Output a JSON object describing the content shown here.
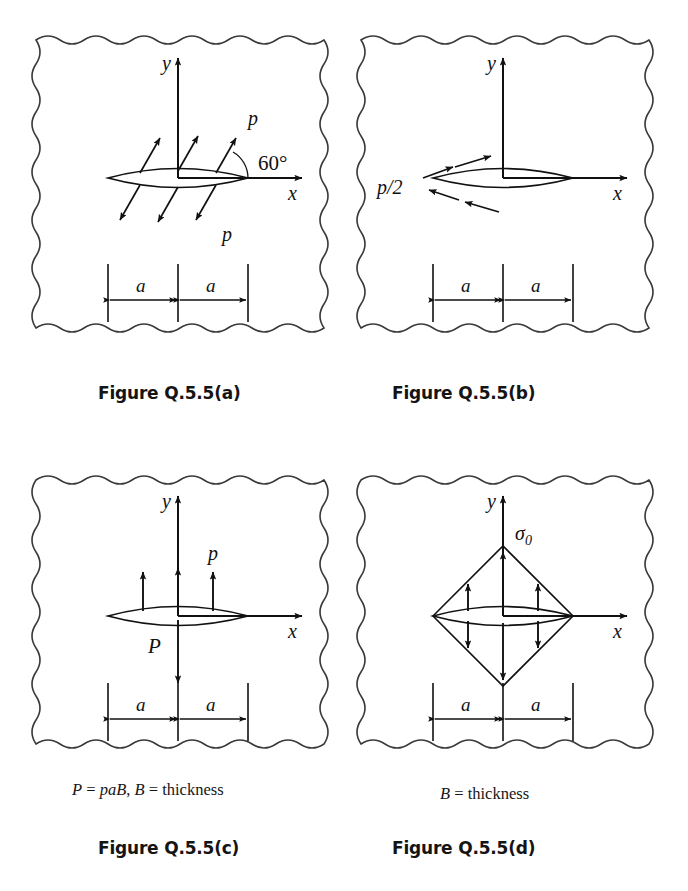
{
  "figure": {
    "title_prefix": "Figure Q.5.5",
    "background": "#ffffff",
    "ink": "#111111"
  },
  "panels": [
    {
      "id": "a",
      "caption": "Figure Q.5.5(a)",
      "axis_x_label": "x",
      "axis_y_label": "y",
      "load_label_top": "p",
      "load_label_bottom": "p",
      "angle_label": "60°",
      "dimension_left": "a",
      "dimension_right": "a",
      "description": "Inclined crack-face pressure p at 60 degrees to the x-axis, acting outward on both crack faces",
      "arrow_angle_deg": 60,
      "arrow_count_per_face": 3,
      "loading_type": "inclined-pressure"
    },
    {
      "id": "b",
      "caption": "Figure Q.5.5(b)",
      "axis_x_label": "x",
      "axis_y_label": "y",
      "load_label": "p/2",
      "dimension_left": "a",
      "dimension_right": "a",
      "description": "Shear traction p/2 applied along the crack faces, upper face to the right and lower face to the left",
      "arrow_count_per_face": 2,
      "loading_type": "shear"
    },
    {
      "id": "c",
      "caption": "Figure Q.5.5(c)",
      "axis_x_label": "x",
      "axis_y_label": "y",
      "load_label_top": "p",
      "point_load_label": "P",
      "dimension_left": "a",
      "dimension_right": "a",
      "note": "P = paB, B = thickness",
      "note_parts": {
        "lhs": "P",
        "eq": "=",
        "rhs": "paB",
        "comma": ",",
        "thickness": "B = thickness"
      },
      "description": "Uniform pressure p on the upper crack face balanced by a concentrated force P acting downward at the crack centre",
      "arrow_count": 3,
      "loading_type": "pressure-and-point-load"
    },
    {
      "id": "d",
      "caption": "Figure Q.5.5(d)",
      "axis_x_label": "x",
      "axis_y_label": "y",
      "stress_label": "σ",
      "stress_subscript": "0",
      "dimension_left": "a",
      "dimension_right": "a",
      "note": "B = thickness",
      "description": "Triangular (diamond) distribution of normal stress sigma-zero opening the crack, peaking at the crack centre and vanishing at the crack tips",
      "arrow_count_per_face": 3,
      "loading_type": "triangular-distributed-stress"
    }
  ],
  "geometry": {
    "crack_half_length_symbol": "a",
    "axes": [
      "x",
      "y"
    ],
    "border_style": "hand-drawn wavy rectangle"
  }
}
